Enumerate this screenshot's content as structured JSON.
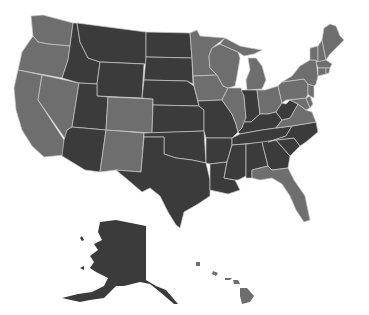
{
  "map": {
    "title": "",
    "region": "United States",
    "projection": "Albers USA (Alaska & Hawaii inset)",
    "colors": {
      "category_dark": "#3b3b3b",
      "category_medium": "#6e6e6e",
      "border": "#c8c8c8",
      "background": "#ffffff"
    },
    "legend": null,
    "states": [
      {
        "code": "WA",
        "category": "medium"
      },
      {
        "code": "OR",
        "category": "medium"
      },
      {
        "code": "CA",
        "category": "medium"
      },
      {
        "code": "NV",
        "category": "medium"
      },
      {
        "code": "ID",
        "category": "dark"
      },
      {
        "code": "MT",
        "category": "dark"
      },
      {
        "code": "WY",
        "category": "dark"
      },
      {
        "code": "UT",
        "category": "dark"
      },
      {
        "code": "AZ",
        "category": "dark"
      },
      {
        "code": "CO",
        "category": "medium"
      },
      {
        "code": "NM",
        "category": "medium"
      },
      {
        "code": "ND",
        "category": "dark"
      },
      {
        "code": "SD",
        "category": "dark"
      },
      {
        "code": "NE",
        "category": "dark"
      },
      {
        "code": "KS",
        "category": "dark"
      },
      {
        "code": "OK",
        "category": "dark"
      },
      {
        "code": "TX",
        "category": "dark"
      },
      {
        "code": "MN",
        "category": "medium"
      },
      {
        "code": "IA",
        "category": "medium"
      },
      {
        "code": "MO",
        "category": "dark"
      },
      {
        "code": "AR",
        "category": "dark"
      },
      {
        "code": "LA",
        "category": "dark"
      },
      {
        "code": "WI",
        "category": "medium"
      },
      {
        "code": "IL",
        "category": "medium"
      },
      {
        "code": "MI",
        "category": "medium"
      },
      {
        "code": "IN",
        "category": "dark"
      },
      {
        "code": "OH",
        "category": "medium"
      },
      {
        "code": "KY",
        "category": "dark"
      },
      {
        "code": "TN",
        "category": "dark"
      },
      {
        "code": "MS",
        "category": "dark"
      },
      {
        "code": "AL",
        "category": "dark"
      },
      {
        "code": "GA",
        "category": "dark"
      },
      {
        "code": "FL",
        "category": "medium"
      },
      {
        "code": "SC",
        "category": "dark"
      },
      {
        "code": "NC",
        "category": "dark"
      },
      {
        "code": "VA",
        "category": "medium"
      },
      {
        "code": "WV",
        "category": "dark"
      },
      {
        "code": "MD",
        "category": "medium"
      },
      {
        "code": "DE",
        "category": "medium"
      },
      {
        "code": "PA",
        "category": "medium"
      },
      {
        "code": "NJ",
        "category": "medium"
      },
      {
        "code": "NY",
        "category": "medium"
      },
      {
        "code": "CT",
        "category": "medium"
      },
      {
        "code": "RI",
        "category": "medium"
      },
      {
        "code": "MA",
        "category": "medium"
      },
      {
        "code": "VT",
        "category": "medium"
      },
      {
        "code": "NH",
        "category": "medium"
      },
      {
        "code": "ME",
        "category": "medium"
      },
      {
        "code": "AK",
        "category": "dark"
      },
      {
        "code": "HI",
        "category": "medium"
      }
    ]
  }
}
